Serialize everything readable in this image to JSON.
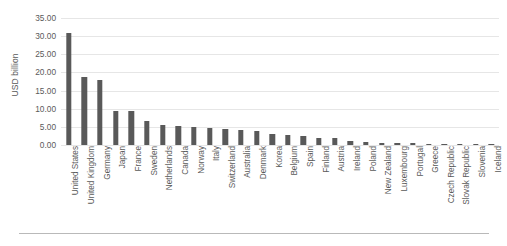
{
  "chart_data": {
    "type": "bar",
    "title": "",
    "xlabel": "",
    "ylabel": "USD billion",
    "ylim": [
      0,
      35
    ],
    "ytick_values": [
      0,
      5,
      10,
      15,
      20,
      25,
      30,
      35
    ],
    "ytick_labels": [
      "0.00",
      "5.00",
      "10.00",
      "15.00",
      "20.00",
      "25.00",
      "30.00",
      "35.00"
    ],
    "grid": true,
    "legend": "none",
    "bar_color": "#595959",
    "gridline_color": "#e6e6e6",
    "axis_text_color": "#5a5a5a",
    "categories": [
      "United States",
      "United Kingdom",
      "Germany",
      "Japan",
      "France",
      "Sweden",
      "Netherlands",
      "Canada",
      "Norway",
      "Italy",
      "Switzerland",
      "Australia",
      "Denmark",
      "Korea",
      "Belgium",
      "Spain",
      "Finland",
      "Austria",
      "Ireland",
      "Poland",
      "New Zealand",
      "Luxembourg",
      "Portugal",
      "Greece",
      "Czech Republic",
      "Slovak Republic",
      "Slovenia",
      "Iceland"
    ],
    "values": [
      31.0,
      18.8,
      17.8,
      9.4,
      9.3,
      6.7,
      5.6,
      5.2,
      4.9,
      4.8,
      4.4,
      4.2,
      3.8,
      3.0,
      2.7,
      2.6,
      2.0,
      1.8,
      1.1,
      0.9,
      0.6,
      0.5,
      0.45,
      0.4,
      0.3,
      0.25,
      0.2,
      0.15
    ]
  }
}
